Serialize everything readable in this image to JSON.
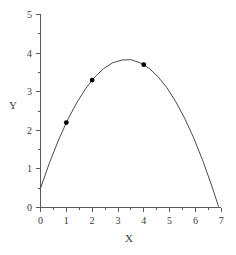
{
  "chart_data": {
    "type": "line",
    "title": "",
    "subtitle": "",
    "xlabel": "X",
    "ylabel": "Y",
    "xlim": [
      0,
      7
    ],
    "ylim": [
      0,
      5
    ],
    "grid": false,
    "legend": null,
    "x_ticks": [
      0,
      1,
      2,
      3,
      4,
      5,
      6,
      7
    ],
    "x_tick_labels": [
      "0",
      "1",
      "2",
      "3",
      "4",
      "5",
      "6",
      "7"
    ],
    "x_minor_ticks": [
      0.5,
      1.5,
      2.5,
      3.5,
      4.5,
      5.5,
      6.5
    ],
    "y_ticks": [
      0,
      1,
      2,
      3,
      4,
      5
    ],
    "y_tick_labels": [
      "0",
      "1",
      "2",
      "3",
      "4",
      "5"
    ],
    "y_minor_ticks": [
      0.5,
      1.5,
      2.5,
      3.5,
      4.5
    ],
    "curve_color": "#4a4a4a",
    "marker_color": "#000000",
    "axis_color": "#5a5a5a",
    "curve": {
      "name": "fitted-parabola",
      "equation": "y = 0.5 + 2.0x - 0.30x^2",
      "x": [
        0.0,
        0.35,
        0.7,
        1.05,
        1.4,
        1.75,
        2.1,
        2.45,
        2.8,
        3.15,
        3.5,
        3.85,
        4.2,
        4.55,
        4.9,
        5.25,
        5.6,
        5.95,
        6.3,
        6.65,
        6.9
      ],
      "y": [
        0.5,
        1.16,
        1.75,
        2.27,
        2.71,
        3.08,
        3.38,
        3.6,
        3.75,
        3.82,
        3.83,
        3.75,
        3.61,
        3.39,
        3.1,
        2.73,
        2.29,
        1.78,
        1.19,
        0.53,
        0.02
      ]
    },
    "points": {
      "name": "data-points",
      "x": [
        1,
        2,
        4
      ],
      "y": [
        2.2,
        3.3,
        3.7
      ]
    },
    "annotations": {
      "y_intercept": 0.5,
      "vertex_x": 3.33,
      "vertex_y": 3.83,
      "right_root_x": 6.9
    }
  }
}
